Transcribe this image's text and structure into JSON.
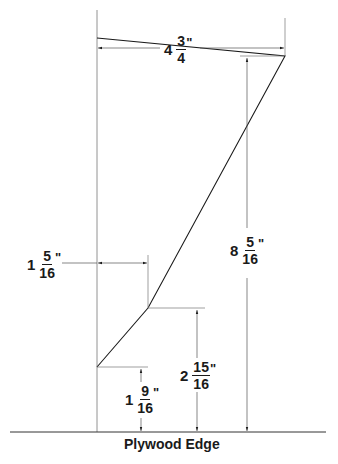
{
  "drawing": {
    "edge_label": "Plywood Edge",
    "dimensions": {
      "top_width": {
        "whole": "4",
        "num": "3",
        "den": "4",
        "unit": "\""
      },
      "total_height": {
        "whole": "8",
        "num": "5",
        "den": "16",
        "unit": "\""
      },
      "knee_offset": {
        "whole": "1",
        "num": "5",
        "den": "16",
        "unit": "\""
      },
      "knee_height": {
        "whole": "2",
        "num": "15",
        "den": "16",
        "unit": "\""
      },
      "base_height": {
        "whole": "1",
        "num": "9",
        "den": "16",
        "unit": "\""
      }
    },
    "colors": {
      "line": "#1a1a1a",
      "thin_line": "#555555",
      "background": "#ffffff"
    }
  }
}
